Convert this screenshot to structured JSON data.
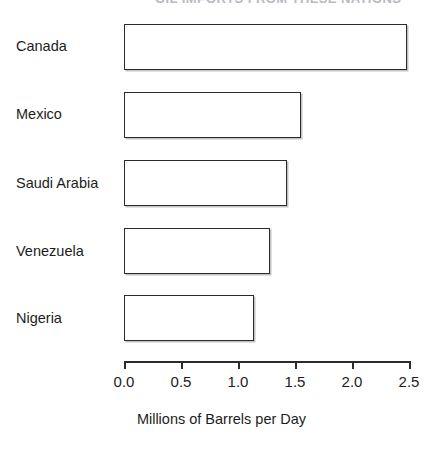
{
  "figure": {
    "cropped_title_fragment": "OIL IMPORTS FROM THESE NATIONS",
    "axis_title": "Millions of Barrels per Day"
  },
  "axis": {
    "tick_labels": [
      "0.0",
      "0.5",
      "1.0",
      "1.5",
      "2.0",
      "2.5"
    ]
  },
  "chart_data": {
    "type": "bar",
    "orientation": "horizontal",
    "title": "",
    "xlabel": "Millions of Barrels per Day",
    "ylabel": "",
    "categories": [
      "Canada",
      "Mexico",
      "Saudi Arabia",
      "Venezuela",
      "Nigeria"
    ],
    "values": [
      2.48,
      1.55,
      1.43,
      1.28,
      1.14
    ],
    "xlim": [
      0.0,
      2.5
    ],
    "xticks": [
      0.0,
      0.5,
      1.0,
      1.5,
      2.0,
      2.5
    ],
    "grid": false,
    "legend": false,
    "bar_fill_color": "#ffffff",
    "bar_edge_color": "#2b2b2b",
    "background_color": "#ffffff"
  }
}
